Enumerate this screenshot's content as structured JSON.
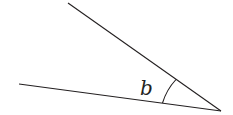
{
  "diagram": {
    "type": "angle",
    "angle_label": "b",
    "stroke_color": "#231f20",
    "vertex": [
      221,
      111
    ],
    "ray_upper_end": [
      68,
      3
    ],
    "ray_lower_end": [
      19,
      84
    ],
    "arc": {
      "start": [
        162,
        102
      ],
      "end": [
        176,
        80
      ]
    }
  }
}
